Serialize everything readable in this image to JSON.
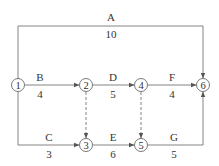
{
  "diagram": {
    "type": "activity-on-arrow network",
    "nodes": [
      {
        "id": "1",
        "label": "1",
        "x": 18,
        "y": 85
      },
      {
        "id": "2",
        "label": "2",
        "x": 86,
        "y": 85
      },
      {
        "id": "3",
        "label": "3",
        "x": 86,
        "y": 145
      },
      {
        "id": "4",
        "label": "4",
        "x": 141,
        "y": 85
      },
      {
        "id": "5",
        "label": "5",
        "x": 141,
        "y": 145
      },
      {
        "id": "6",
        "label": "6",
        "x": 203,
        "y": 85
      }
    ],
    "activities": [
      {
        "name": "A",
        "duration": "10",
        "from": "1",
        "to": "6"
      },
      {
        "name": "B",
        "duration": "4",
        "from": "1",
        "to": "2"
      },
      {
        "name": "C",
        "duration": "3",
        "from": "1",
        "to": "3"
      },
      {
        "name": "D",
        "duration": "5",
        "from": "2",
        "to": "4"
      },
      {
        "name": "E",
        "duration": "6",
        "from": "3",
        "to": "5"
      },
      {
        "name": "F",
        "duration": "4",
        "from": "4",
        "to": "6"
      },
      {
        "name": "G",
        "duration": "5",
        "from": "5",
        "to": "6"
      }
    ],
    "dummies": [
      {
        "from": "2",
        "to": "3"
      },
      {
        "from": "4",
        "to": "5"
      }
    ],
    "colors": {
      "line": "#555555",
      "text": "#333333"
    }
  }
}
